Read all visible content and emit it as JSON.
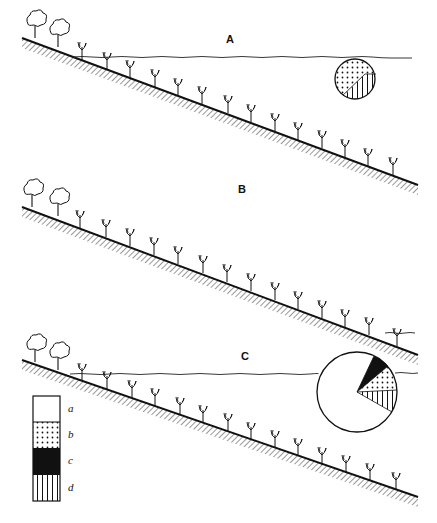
{
  "panels": [
    {
      "label": "A",
      "label_pos": [
        226,
        38
      ]
    },
    {
      "label": "B",
      "label_pos": [
        238,
        188
      ]
    },
    {
      "label": "C",
      "label_pos": [
        241,
        348
      ]
    }
  ],
  "legend": {
    "items": [
      {
        "key": "a",
        "pattern": "blank"
      },
      {
        "key": "b",
        "pattern": "dotted"
      },
      {
        "key": "c",
        "pattern": "solid-black"
      },
      {
        "key": "d",
        "pattern": "vertical-stripes"
      }
    ]
  },
  "pies": {
    "A": {
      "segments": [
        "dotted",
        "vertical-stripes"
      ]
    },
    "C": {
      "segments": [
        "blank",
        "solid-black",
        "dotted",
        "vertical-stripes"
      ]
    }
  }
}
